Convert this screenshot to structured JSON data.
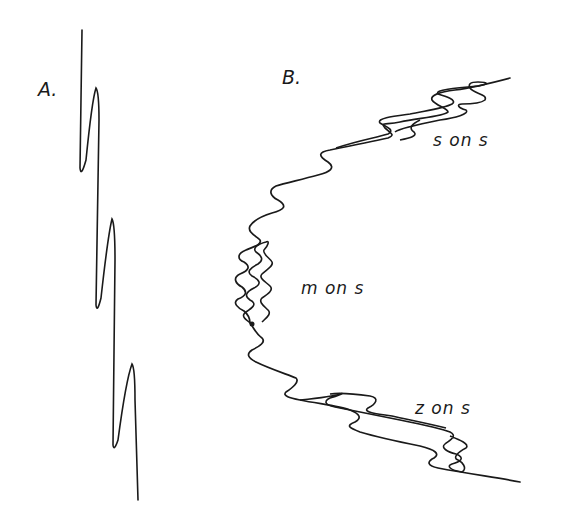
{
  "figure": {
    "panels": [
      {
        "id": "A",
        "label": "A."
      },
      {
        "id": "B",
        "label": "B."
      }
    ],
    "fold_labels": [
      {
        "text": "s on s"
      },
      {
        "text": "m on s"
      },
      {
        "text": "z on s"
      }
    ],
    "colors": {
      "line": "#1a1a1a",
      "background": "#ffffff"
    }
  }
}
